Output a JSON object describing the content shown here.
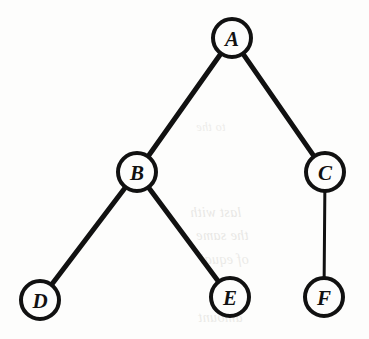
{
  "figure": {
    "kind": "binary-tree-diagram",
    "width": 369,
    "height": 339,
    "background_color": "#fdfdfc",
    "ink_color": "#111111"
  },
  "chart_data": {
    "type": "diagram",
    "subtype": "rooted-binary-tree",
    "title": "",
    "root": "A",
    "nodes": [
      {
        "id": "A",
        "label": "A",
        "x": 232,
        "y": 38,
        "r": 21,
        "depth": 0,
        "parent": null,
        "side": "root",
        "stroke_width": 4,
        "font_size": 21
      },
      {
        "id": "B",
        "label": "B",
        "x": 137,
        "y": 172,
        "r": 21,
        "depth": 1,
        "parent": "A",
        "side": "left",
        "stroke_width": 4,
        "font_size": 21
      },
      {
        "id": "C",
        "label": "C",
        "x": 325,
        "y": 172,
        "r": 21,
        "depth": 1,
        "parent": "A",
        "side": "right",
        "stroke_width": 4,
        "font_size": 21
      },
      {
        "id": "D",
        "label": "D",
        "x": 40,
        "y": 300,
        "r": 21,
        "depth": 2,
        "parent": "B",
        "side": "left",
        "stroke_width": 4,
        "font_size": 21
      },
      {
        "id": "E",
        "label": "E",
        "x": 230,
        "y": 297,
        "r": 21,
        "depth": 2,
        "parent": "B",
        "side": "right",
        "stroke_width": 4,
        "font_size": 21
      },
      {
        "id": "F",
        "label": "F",
        "x": 324,
        "y": 297,
        "r": 21,
        "depth": 2,
        "parent": "C",
        "side": "left",
        "stroke_width": 4,
        "font_size": 21
      }
    ],
    "edges": [
      {
        "id": "A-B",
        "from": "A",
        "to": "B",
        "stroke_width": 5
      },
      {
        "id": "A-C",
        "from": "A",
        "to": "C",
        "stroke_width": 5
      },
      {
        "id": "B-D",
        "from": "B",
        "to": "D",
        "stroke_width": 5
      },
      {
        "id": "B-E",
        "from": "B",
        "to": "E",
        "stroke_width": 5
      },
      {
        "id": "C-F",
        "from": "C",
        "to": "F",
        "stroke_width": 3
      }
    ],
    "legend": [],
    "annotations": []
  },
  "scan_artifacts": {
    "description": "faint mirrored show-through text from the reverse page",
    "lines": [
      {
        "id": "bleed-1",
        "text": "to the",
        "x": 196,
        "y": 120,
        "size": 12,
        "opacity": 0.35
      },
      {
        "id": "bleed-2",
        "text": "last with",
        "x": 190,
        "y": 205,
        "size": 14,
        "opacity": 0.45
      },
      {
        "id": "bleed-3",
        "text": "the same",
        "x": 196,
        "y": 228,
        "size": 14,
        "opacity": 0.45
      },
      {
        "id": "bleed-4",
        "text": "of equal",
        "x": 200,
        "y": 252,
        "size": 14,
        "opacity": 0.4
      },
      {
        "id": "bleed-5",
        "text": "amount",
        "x": 198,
        "y": 310,
        "size": 14,
        "opacity": 0.4
      }
    ]
  }
}
